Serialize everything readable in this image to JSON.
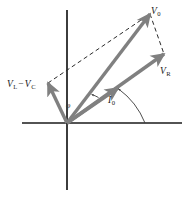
{
  "figure": {
    "type": "phasor-diagram",
    "title": "",
    "background_color": "#ffffff",
    "axis_color": "#1a1a1a",
    "vector_color": "#808080",
    "dashed_color": "#2b2b2b",
    "label_color": "#1a1a1a"
  },
  "axes": {
    "origin": {
      "x": 67,
      "y": 123
    },
    "horizontal": {
      "x1": 22,
      "y1": 123,
      "x2": 182,
      "y2": 123
    },
    "vertical": {
      "x1": 67,
      "y1": 10,
      "x2": 67,
      "y2": 190
    }
  },
  "vectors": [
    {
      "name": "V0",
      "label_html": "V<sub>0</sub>",
      "label_text": "V0",
      "from": {
        "x": 67,
        "y": 123
      },
      "to": {
        "x": 150,
        "y": 14
      },
      "color": "#808080",
      "style": "solid-arrow"
    },
    {
      "name": "VR",
      "label_html": "V<sub>R</sub>",
      "label_text": "VR",
      "from": {
        "x": 67,
        "y": 123
      },
      "to": {
        "x": 164,
        "y": 54
      },
      "color": "#808080",
      "style": "solid-arrow"
    },
    {
      "name": "VL-VC",
      "label_html": "V<sub>L</sub> &minus; V<sub>C</sub>",
      "label_text": "VL - VC",
      "from": {
        "x": 67,
        "y": 123
      },
      "to": {
        "x": 48,
        "y": 83
      },
      "color": "#808080",
      "style": "solid-arrow"
    },
    {
      "name": "I0",
      "label_html": "I<sub>0</sub>",
      "label_text": "I0",
      "from": {
        "x": 67,
        "y": 123
      },
      "to": {
        "x": 118,
        "y": 88
      },
      "color": "#808080",
      "style": "solid-arrow"
    }
  ],
  "dashed_lines": [
    {
      "name": "vlvc-to-v0",
      "from": {
        "x": 48,
        "y": 83
      },
      "to": {
        "x": 150,
        "y": 14
      }
    },
    {
      "name": "v0-to-vr",
      "from": {
        "x": 150,
        "y": 14
      },
      "to": {
        "x": 164,
        "y": 54
      }
    }
  ],
  "angles": [
    {
      "name": "phi",
      "label_text": "φ",
      "description": "angle between I0 and V0",
      "vertex": {
        "x": 67,
        "y": 123
      },
      "radius": 40
    },
    {
      "name": "i0-axis-angle",
      "label_text": "I0",
      "description": "arc from horizontal axis to I0 vector",
      "vertex": {
        "x": 67,
        "y": 123
      },
      "radius": 78
    }
  ],
  "labels": {
    "v0": {
      "v": "V",
      "sub": "0"
    },
    "vr": {
      "v": "V",
      "sub": "R"
    },
    "vl": {
      "v": "V",
      "sub": "L"
    },
    "vc": {
      "v": "V",
      "sub": "C"
    },
    "minus": "−",
    "i0": {
      "v": "I",
      "sub": "0"
    },
    "phi": "φ"
  }
}
